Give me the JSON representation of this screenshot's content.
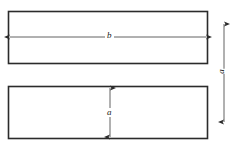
{
  "figure": {
    "background_color": "#ffffff",
    "line_color": "#2b2b2b",
    "dimension_line_color": "#3a3a3a",
    "shapes": [
      {
        "name": "upper-rectangle",
        "x": 8,
        "y": 11,
        "width": 200,
        "height": 53
      },
      {
        "name": "lower-rectangle",
        "x": 8,
        "y": 86,
        "width": 200,
        "height": 53
      }
    ],
    "dimensions": [
      {
        "name": "width-dimension",
        "label": "b",
        "orientation": "horizontal",
        "from_x": 10,
        "to_x": 206,
        "y": 37,
        "describes": "overall width of upper rectangle"
      },
      {
        "name": "height-dimension",
        "label": "a",
        "orientation": "vertical",
        "x": 110,
        "from_y": 88,
        "to_y": 137,
        "describes": "height of lower rectangle"
      },
      {
        "name": "spacing-dimension",
        "label": "a",
        "orientation": "vertical-rotated",
        "x": 224,
        "from_y": 24,
        "to_y": 122,
        "describes": "vertical separation measured at right side"
      }
    ]
  }
}
